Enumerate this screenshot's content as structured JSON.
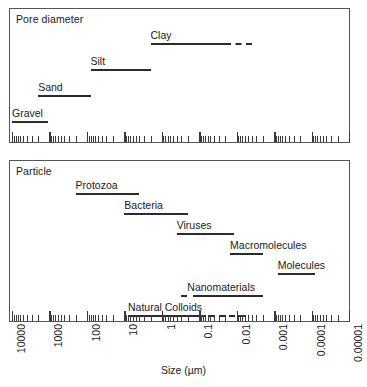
{
  "figure": {
    "axis_title": "Size (µm)",
    "axis_tick_labels": [
      "10000",
      "1000",
      "100",
      "10",
      "1",
      "0.1",
      "0.01",
      "0.001",
      "0.0001",
      "0.00001"
    ],
    "axis_tick_values": [
      10000,
      1000,
      100,
      10,
      1,
      0.1,
      0.01,
      0.001,
      0.0001,
      1e-05
    ]
  },
  "panels": {
    "pore": {
      "title": "Pore diameter"
    },
    "particle": {
      "title": "Particle"
    }
  },
  "chart_data": {
    "type": "bar",
    "xlabel": "Size (µm)",
    "ylabel": "",
    "xscale": "log",
    "xlim": [
      10000,
      1e-05
    ],
    "grid": false,
    "legend": "none",
    "xticks": [
      10000,
      1000,
      100,
      10,
      1,
      0.1,
      0.01,
      0.001,
      0.0001,
      1e-05
    ],
    "xticklabels": [
      "10000",
      "1000",
      "100",
      "10",
      "1",
      "0.1",
      "0.01",
      "0.001",
      "0.0001",
      "0.00001"
    ],
    "panels": [
      {
        "name": "Pore diameter",
        "items": [
          {
            "label": "Gravel",
            "solid_range": [
              10000,
              1100
            ],
            "dashed_range": null
          },
          {
            "label": "Sand",
            "solid_range": [
              2000,
              80
            ],
            "dashed_range": null
          },
          {
            "label": "Silt",
            "solid_range": [
              80,
              2
            ],
            "dashed_range": null
          },
          {
            "label": "Clay",
            "solid_range": [
              2,
              0.02
            ],
            "dashed_range": [
              0.02,
              0.004
            ]
          }
        ]
      },
      {
        "name": "Particle",
        "items": [
          {
            "label": "Protozoa",
            "solid_range": [
              200,
              4
            ],
            "dashed_range": null
          },
          {
            "label": "Bacteria",
            "solid_range": [
              10,
              0.2
            ],
            "dashed_range": null
          },
          {
            "label": "Viruses",
            "solid_range": [
              0.4,
              0.012
            ],
            "dashed_range": null
          },
          {
            "label": "Macromolecules",
            "solid_range": [
              0.015,
              0.002
            ],
            "dashed_range": null
          },
          {
            "label": "Molecules",
            "solid_range": [
              0.0008,
              8e-05
            ],
            "dashed_range": null
          },
          {
            "label": "Nanomaterials",
            "solid_range": [
              0.1,
              0.002
            ],
            "dashed_range": [
              0.3,
              0.1
            ]
          },
          {
            "label": "Natural Colloids",
            "solid_range": [
              8,
              0.1
            ],
            "dashed_range": [
              0.1,
              0.006
            ]
          }
        ]
      }
    ]
  }
}
